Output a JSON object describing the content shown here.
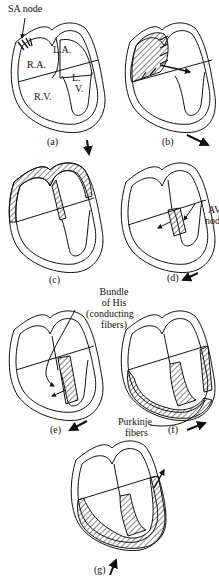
{
  "diagram": {
    "panels": [
      {
        "id": "a",
        "caption": "(a)",
        "arrow_direction": "down-right"
      },
      {
        "id": "b",
        "caption": "(b)",
        "arrow_direction": "right-down"
      },
      {
        "id": "c",
        "caption": "(c)",
        "arrow_direction": "none"
      },
      {
        "id": "d",
        "caption": "(d)",
        "arrow_direction": "down-left"
      },
      {
        "id": "e",
        "caption": "(e)",
        "arrow_direction": "down-left"
      },
      {
        "id": "f",
        "caption": "(f)",
        "arrow_direction": "up-right"
      },
      {
        "id": "g",
        "caption": "(g)",
        "arrow_direction": "up"
      }
    ],
    "labels": {
      "sa_node": "SA node",
      "ra": "R.A.",
      "la": "L.A.",
      "lv_1": "L.",
      "lv_2": "V.",
      "rv": "R.V.",
      "av_node_1": "AV",
      "av_node_2": "node",
      "bundle_1": "Bundle",
      "bundle_2": "of His",
      "bundle_3": "(conducting",
      "bundle_4": "fibers)",
      "purkinje_1": "Purkinje",
      "purkinje_2": "fibers"
    },
    "colors": {
      "ink": "#111111",
      "background": "#ffffff"
    }
  }
}
